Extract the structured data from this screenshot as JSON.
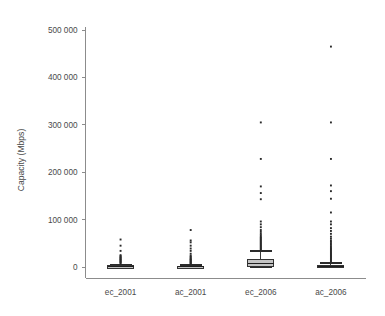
{
  "chart_data": {
    "type": "box",
    "title": "",
    "xlabel": "",
    "ylabel": "Capacity (Mbps)",
    "categories": [
      "ec_2001",
      "ac_2001",
      "ec_2006",
      "ac_2006"
    ],
    "ylim": [
      0,
      520000
    ],
    "yticks": [
      0,
      100000,
      200000,
      300000,
      400000,
      500000
    ],
    "ytick_labels": [
      "0",
      "100 000",
      "200 000",
      "300 000",
      "400 000",
      "500 000"
    ],
    "grid": false,
    "legend": "none",
    "colors": {
      "box_fill": "#c4c4c4",
      "box_edge": "#333333",
      "outlier": "#2a2a2a",
      "axis": "#8c8c8c",
      "text": "#4a4a4a",
      "background": "#ffffff"
    },
    "boxes": [
      {
        "category": "ec_2001",
        "q1": 120,
        "median": 800,
        "q3": 2400,
        "whisker_low": 0,
        "whisker_high": 5600,
        "outliers": [
          7000,
          9000,
          10500,
          12000,
          13500,
          15000,
          16500,
          18000,
          19500,
          21000,
          23000,
          25000,
          34000,
          45000,
          58000
        ]
      },
      {
        "category": "ac_2001",
        "q1": 100,
        "median": 600,
        "q3": 1900,
        "whisker_low": 0,
        "whisker_high": 4500,
        "outliers": [
          6000,
          7500,
          9000,
          10500,
          12000,
          13500,
          15000,
          16500,
          18000,
          20000,
          22000,
          24000,
          28000,
          34000,
          39000,
          45000,
          52000,
          56000,
          78000
        ]
      },
      {
        "category": "ec_2006",
        "q1": 2000,
        "median": 6500,
        "q3": 15500,
        "whisker_low": 0,
        "whisker_high": 34000,
        "outliers": [
          36000,
          38000,
          40000,
          42000,
          44000,
          46000,
          48000,
          50000,
          52000,
          54000,
          56000,
          58000,
          60000,
          62000,
          64000,
          67000,
          70000,
          74000,
          78000,
          84000,
          90000,
          96000,
          143000,
          156000,
          170000,
          228000,
          305000
        ]
      },
      {
        "category": "ac_2006",
        "q1": 200,
        "median": 1200,
        "q3": 3200,
        "whisker_low": 0,
        "whisker_high": 9000,
        "outliers": [
          11000,
          13000,
          15000,
          17000,
          19000,
          21000,
          23000,
          25000,
          27000,
          29000,
          31000,
          33000,
          35000,
          37000,
          39000,
          41000,
          44000,
          47000,
          50000,
          53000,
          56000,
          60000,
          64000,
          70000,
          76000,
          82000,
          90000,
          96000,
          115000,
          144000,
          160000,
          172000,
          228000,
          305000,
          465000
        ]
      }
    ]
  }
}
